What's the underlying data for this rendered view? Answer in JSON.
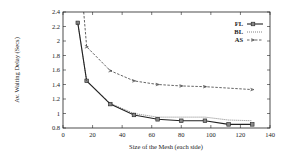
{
  "chart_data": {
    "type": "line",
    "title": "",
    "xlabel": "Size of the Mesh (each side)",
    "ylabel": "Av. Waiting Delay (Secs)",
    "xlim": [
      0,
      140
    ],
    "ylim": [
      0.8,
      2.4
    ],
    "xticks": [
      0,
      20,
      40,
      60,
      80,
      100,
      120,
      140
    ],
    "yticks": [
      0.8,
      1,
      1.2,
      1.4,
      1.6,
      1.8,
      2,
      2.2,
      2.4
    ],
    "xtick_labels": [
      "0",
      "20",
      "40",
      "60",
      "80",
      "100",
      "120",
      "140"
    ],
    "ytick_labels": [
      "0.8",
      "1",
      "1.2",
      "1.4",
      "1.6",
      "1.8",
      "2",
      "2.2",
      "2.4"
    ],
    "grid": false,
    "legend_position": "upper right",
    "series": [
      {
        "name": "FL",
        "style": "solid",
        "marker": "square",
        "x": [
          10,
          16,
          32,
          48,
          64,
          80,
          96,
          112,
          128
        ],
        "values": [
          2.25,
          1.45,
          1.13,
          0.98,
          0.92,
          0.9,
          0.9,
          0.85,
          0.85
        ]
      },
      {
        "name": "BL",
        "style": "dotted",
        "marker": "none",
        "x": [
          10,
          16,
          32,
          48,
          64,
          80,
          96,
          112,
          128
        ],
        "values": [
          2.25,
          1.45,
          1.14,
          1.0,
          0.95,
          0.95,
          0.95,
          0.91,
          0.9
        ]
      },
      {
        "name": "AS",
        "style": "dashed",
        "marker": "arrow",
        "x": [
          14,
          16,
          32,
          48,
          64,
          80,
          96,
          128
        ],
        "values": [
          2.4,
          1.92,
          1.59,
          1.45,
          1.4,
          1.38,
          1.37,
          1.33
        ]
      }
    ]
  },
  "legend": {
    "items": [
      {
        "label": "FL"
      },
      {
        "label": "BL"
      },
      {
        "label": "AS"
      }
    ]
  },
  "colors": {
    "line": "#222222",
    "background": "#ffffff"
  }
}
